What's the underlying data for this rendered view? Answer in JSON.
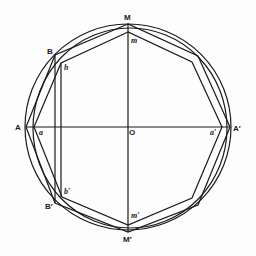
{
  "diagram": {
    "title": "",
    "style": {
      "stroke": "#1a1a1a",
      "background": "#fdfdfd"
    },
    "labels": {
      "M": "M",
      "m": "m",
      "B": "B",
      "h": "h",
      "A": "A",
      "a": "a",
      "O": "O",
      "a_prime": "a′",
      "A_prime": "A′",
      "b_prime": "b′",
      "B_prime": "B′",
      "m_prime": "m′",
      "M_prime": "M′"
    },
    "shapes": [
      "outer circle centered at O",
      "inscribed polygon through A, B, M, A′, M′, B′",
      "inner polygon through a, h, m, a′, m′, b′",
      "inner arc circle",
      "horizontal diameter A–A′",
      "vertical diameter M–M′",
      "vertical chords B–B′ and h–b′"
    ]
  }
}
